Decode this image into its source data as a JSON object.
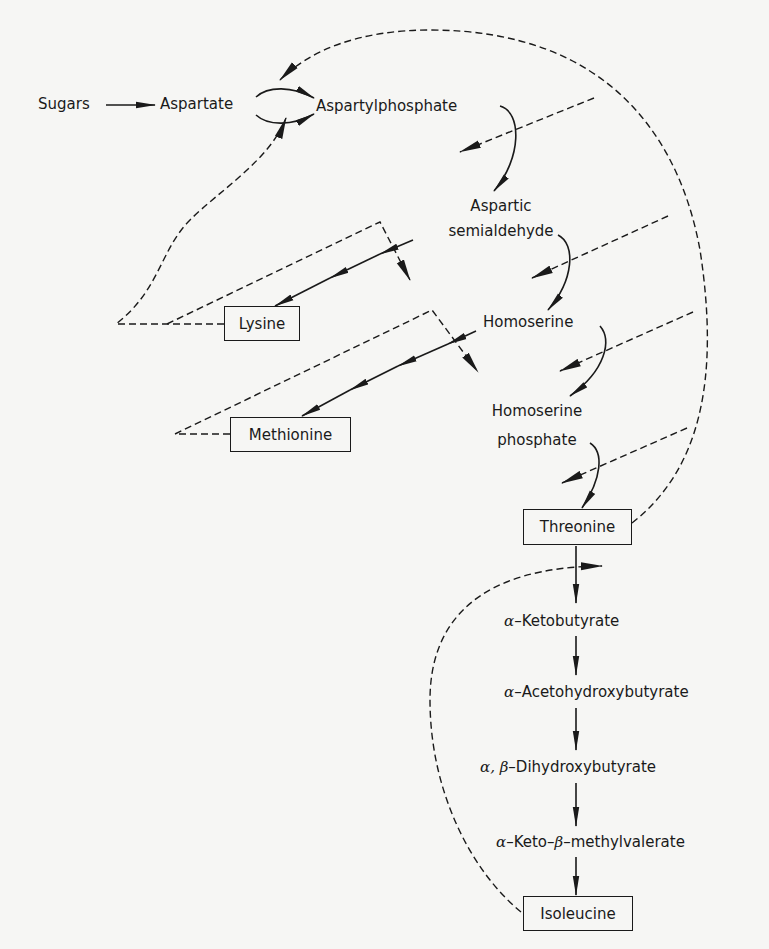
{
  "diagram": {
    "type": "metabolic-pathway-with-feedback-inhibition",
    "nodes": {
      "sugars": "Sugars",
      "aspartate": "Aspartate",
      "aspartylphosphate": "Aspartylphosphate",
      "aspartic_semialdehyde_line1": "Aspartic",
      "aspartic_semialdehyde_line2": "semialdehyde",
      "homoserine": "Homoserine",
      "homoserine_phosphate_line1": "Homoserine",
      "homoserine_phosphate_line2": "phosphate",
      "threonine": "Threonine",
      "lysine": "Lysine",
      "methionine": "Methionine",
      "ketobutyrate_greek": "α",
      "ketobutyrate": "–Ketobutyrate",
      "acetohydroxybutyrate_greek": "α",
      "acetohydroxybutyrate": "–Acetohydroxybutyrate",
      "dihydroxybutyrate_greek": "α, β",
      "dihydroxybutyrate": "–Dihydroxybutyrate",
      "ketomethylvalerate_greek1": "α",
      "ketomethylvalerate_mid": "–Keto–",
      "ketomethylvalerate_greek2": "β",
      "ketomethylvalerate_end": "–methylvalerate",
      "isoleucine": "Isoleucine"
    },
    "end_products_boxed": [
      "Lysine",
      "Methionine",
      "Threonine",
      "Isoleucine"
    ],
    "edges": [
      {
        "from": "Sugars",
        "to": "Aspartate",
        "style": "solid"
      },
      {
        "from": "Aspartate",
        "to": "Aspartylphosphate",
        "style": "solid",
        "note": "two isozyme arrows"
      },
      {
        "from": "Aspartylphosphate",
        "to": "Aspartic semialdehyde",
        "style": "solid"
      },
      {
        "from": "Aspartic semialdehyde",
        "to": "Homoserine",
        "style": "solid"
      },
      {
        "from": "Aspartic semialdehyde",
        "to": "Lysine",
        "style": "solid",
        "note": "multi-step"
      },
      {
        "from": "Homoserine",
        "to": "Homoserine phosphate",
        "style": "solid"
      },
      {
        "from": "Homoserine",
        "to": "Methionine",
        "style": "solid",
        "note": "multi-step"
      },
      {
        "from": "Homoserine phosphate",
        "to": "Threonine",
        "style": "solid"
      },
      {
        "from": "Threonine",
        "to": "α-Ketobutyrate",
        "style": "solid"
      },
      {
        "from": "α-Ketobutyrate",
        "to": "α-Acetohydroxybutyrate",
        "style": "solid"
      },
      {
        "from": "α-Acetohydroxybutyrate",
        "to": "α,β-Dihydroxybutyrate",
        "style": "solid"
      },
      {
        "from": "α,β-Dihydroxybutyrate",
        "to": "α-Keto-β-methylvalerate",
        "style": "solid"
      },
      {
        "from": "α-Keto-β-methylvalerate",
        "to": "Isoleucine",
        "style": "solid"
      }
    ],
    "feedback": [
      {
        "from": "Threonine",
        "inhibits": [
          "Aspartate→Aspartylphosphate",
          "Aspartylphosphate→Aspartic semialdehyde",
          "Aspartic semialdehyde→Homoserine",
          "Homoserine→Homoserine phosphate",
          "Homoserine phosphate→Threonine"
        ],
        "style": "dashed"
      },
      {
        "from": "Lysine",
        "inhibits": [
          "Aspartate→Aspartylphosphate",
          "Aspartic semialdehyde→Lysine (first step)"
        ],
        "style": "dashed"
      },
      {
        "from": "Methionine",
        "inhibits": [
          "Homoserine→Methionine (first step)"
        ],
        "style": "dashed"
      },
      {
        "from": "Isoleucine",
        "inhibits": [
          "Threonine→α-Ketobutyrate"
        ],
        "style": "dashed"
      }
    ],
    "colors": {
      "ink": "#1a1a1a",
      "background": "#f6f6f4"
    }
  }
}
